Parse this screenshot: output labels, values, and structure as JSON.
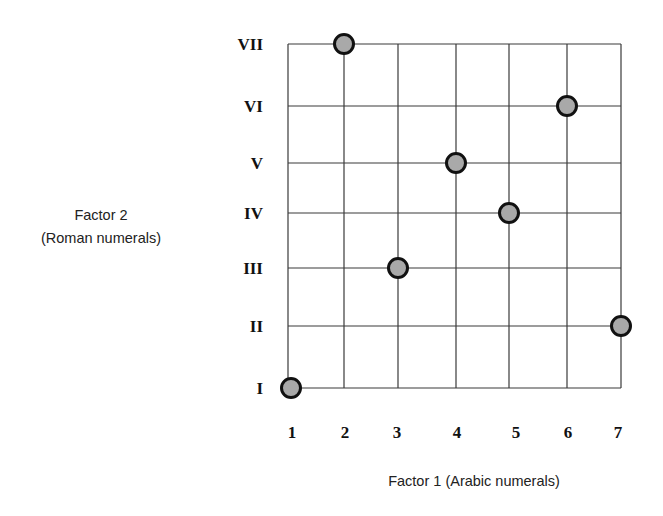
{
  "chart_data": {
    "type": "scatter",
    "title": "",
    "xlabel": "Factor 1 (Arabic numerals)",
    "ylabel_lines": [
      "Factor 2",
      "(Roman numerals)"
    ],
    "x_ticks": [
      "1",
      "2",
      "3",
      "4",
      "5",
      "6",
      "7"
    ],
    "y_ticks": [
      "I",
      "II",
      "III",
      "IV",
      "V",
      "VI",
      "VII"
    ],
    "xlim": [
      1,
      7
    ],
    "ylim": [
      1,
      7
    ],
    "grid": true,
    "legend": null,
    "points": [
      {
        "x": 1,
        "y": 1,
        "x_label": "1",
        "y_label": "I"
      },
      {
        "x": 2,
        "y": 7,
        "x_label": "2",
        "y_label": "VII"
      },
      {
        "x": 3,
        "y": 3,
        "x_label": "3",
        "y_label": "III"
      },
      {
        "x": 4,
        "y": 5,
        "x_label": "4",
        "y_label": "V"
      },
      {
        "x": 5,
        "y": 4,
        "x_label": "5",
        "y_label": "IV"
      },
      {
        "x": 6,
        "y": 6,
        "x_label": "6",
        "y_label": "VI"
      },
      {
        "x": 7,
        "y": 2,
        "x_label": "7",
        "y_label": "II"
      }
    ],
    "marker": {
      "fill": "#a9a9a9",
      "stroke": "#111111"
    }
  },
  "labels": {
    "xlabel": "Factor 1 (Arabic numerals)",
    "ylabel_line1": "Factor 2",
    "ylabel_line2": "(Roman numerals)"
  }
}
